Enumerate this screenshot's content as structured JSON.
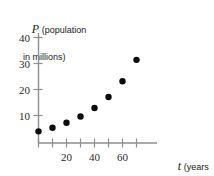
{
  "chart_data": {
    "type": "scatter",
    "title": "",
    "xlabel": "t (years since 1790)",
    "ylabel": "P (population in millions)",
    "x": [
      0,
      10,
      20,
      30,
      40,
      50,
      60,
      70
    ],
    "values": [
      3.9,
      5.3,
      7.2,
      9.6,
      12.9,
      17.1,
      23.2,
      31.4
    ],
    "series": [
      {
        "name": "population",
        "values": [
          3.9,
          5.3,
          7.2,
          9.6,
          12.9,
          17.1,
          23.2,
          31.4
        ]
      }
    ],
    "xlim": [
      -3,
      78
    ],
    "ylim": [
      0,
      44
    ],
    "xticks": [
      0,
      10,
      20,
      30,
      40,
      50,
      60,
      70
    ],
    "xtick_labels": [
      "",
      "",
      "20",
      "",
      "40",
      "",
      "60",
      ""
    ],
    "yticks": [
      10,
      20,
      30,
      40
    ],
    "ytick_labels": [
      "10",
      "20",
      "30",
      "40"
    ],
    "grid": false,
    "legend": "none",
    "marker": "filled-circle",
    "marker_color": "#0d0d0d",
    "axis_color": "#8e8e8e"
  },
  "axes": {
    "y": {
      "symbol": "P",
      "caption_line1": "(population",
      "caption_line2": "in millions)"
    },
    "x": {
      "symbol": "t",
      "caption_line1": "(years",
      "caption_line2": "since 1790)"
    }
  },
  "ticks": {
    "y": [
      {
        "label": "40"
      },
      {
        "label": "30"
      },
      {
        "label": "20"
      },
      {
        "label": "10"
      }
    ],
    "x": [
      {
        "label": "20"
      },
      {
        "label": "40"
      },
      {
        "label": "60"
      }
    ]
  }
}
